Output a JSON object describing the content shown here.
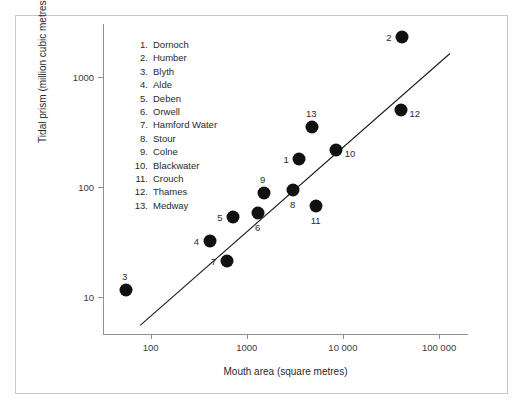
{
  "figure": {
    "x_axis_label": "Mouth area (square metres)",
    "y_axis_label": "Tidal prism (million cubic metres)"
  },
  "legend": {
    "items": [
      {
        "num": "1.",
        "name": "Dornoch"
      },
      {
        "num": "2.",
        "name": "Humber"
      },
      {
        "num": "3.",
        "name": "Blyth"
      },
      {
        "num": "4.",
        "name": "Alde"
      },
      {
        "num": "5.",
        "name": "Deben"
      },
      {
        "num": "6.",
        "name": "Orwell"
      },
      {
        "num": "7.",
        "name": "Hamford Water"
      },
      {
        "num": "8.",
        "name": "Stour"
      },
      {
        "num": "9.",
        "name": "Colne"
      },
      {
        "num": "10.",
        "name": "Blackwater"
      },
      {
        "num": "11.",
        "name": "Crouch"
      },
      {
        "num": "12.",
        "name": "Thames"
      },
      {
        "num": "13.",
        "name": "Medway"
      }
    ]
  },
  "chart_data": {
    "type": "scatter",
    "title": "",
    "xlabel": "Mouth area (square metres)",
    "ylabel": "Tidal prism (million cubic metres)",
    "xscale": "log",
    "yscale": "log",
    "xlim": [
      32,
      200000
    ],
    "ylim": [
      4.5,
      3000
    ],
    "grid": false,
    "legend_position": "inside-upper-left",
    "x_ticks": [
      {
        "value": 100,
        "label": "100"
      },
      {
        "value": 1000,
        "label": "1000"
      },
      {
        "value": 10000,
        "label": "10 000"
      },
      {
        "value": 100000,
        "label": "100 000"
      }
    ],
    "y_ticks": [
      {
        "value": 10,
        "label": "10"
      },
      {
        "value": 100,
        "label": "100"
      },
      {
        "value": 1000,
        "label": "1000"
      }
    ],
    "points": [
      {
        "id": 1,
        "label": "1",
        "name": "Dornoch",
        "x": 3500,
        "y": 180,
        "label_pos": "left"
      },
      {
        "id": 2,
        "label": "2",
        "name": "Humber",
        "x": 41000,
        "y": 2300,
        "label_pos": "left"
      },
      {
        "id": 3,
        "label": "3",
        "name": "Blyth",
        "x": 55,
        "y": 11.5,
        "label_pos": "above"
      },
      {
        "id": 4,
        "label": "4",
        "name": "Alde",
        "x": 410,
        "y": 32,
        "label_pos": "left"
      },
      {
        "id": 5,
        "label": "5",
        "name": "Deben",
        "x": 720,
        "y": 53,
        "label_pos": "left"
      },
      {
        "id": 6,
        "label": "6",
        "name": "Orwell",
        "x": 1300,
        "y": 58,
        "label_pos": "below"
      },
      {
        "id": 7,
        "label": "7",
        "name": "Hamford Water",
        "x": 620,
        "y": 21,
        "label_pos": "left"
      },
      {
        "id": 8,
        "label": "8",
        "name": "Stour",
        "x": 3000,
        "y": 93,
        "label_pos": "below"
      },
      {
        "id": 9,
        "label": "9",
        "name": "Colne",
        "x": 1500,
        "y": 88,
        "label_pos": "above"
      },
      {
        "id": 10,
        "label": "10",
        "name": "Blackwater",
        "x": 8500,
        "y": 215,
        "label_pos": "right"
      },
      {
        "id": 11,
        "label": "11",
        "name": "Crouch",
        "x": 5200,
        "y": 67,
        "label_pos": "below"
      },
      {
        "id": 12,
        "label": "12",
        "name": "Thames",
        "x": 40000,
        "y": 500,
        "label_pos": "right"
      },
      {
        "id": 13,
        "label": "13",
        "name": "Medway",
        "x": 4800,
        "y": 350,
        "label_pos": "above"
      }
    ],
    "trend_line": {
      "type": "linear-fit-loglog",
      "x_start": 78,
      "y_start": 5.5,
      "x_end": 130000,
      "y_end": 1620
    }
  }
}
